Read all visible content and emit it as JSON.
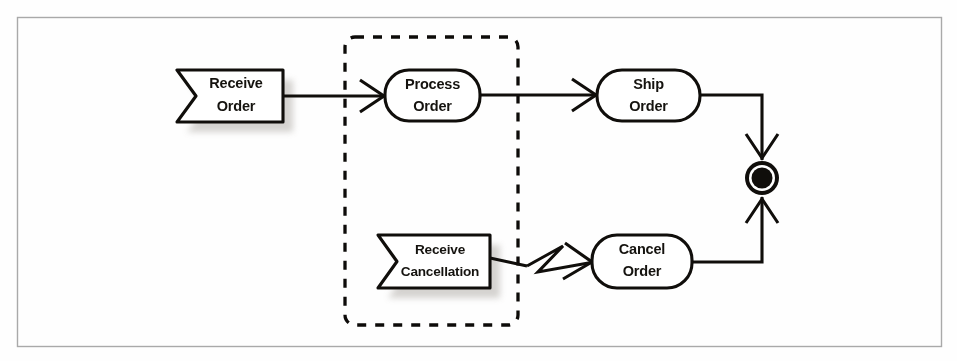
{
  "diagram": {
    "kind": "uml-activity-diagram",
    "background_color": "#fefefe",
    "frame_color": "#a9a9a9",
    "ink_color": "#100e0b",
    "shadow_color": "#b9b4ae"
  },
  "nodes": {
    "receive_order": {
      "id": "receive-order",
      "shape": "signal-receipt-flag",
      "label_line1": "Receive",
      "label_line2": "Order",
      "x": 177,
      "y": 70,
      "w": 106,
      "h": 52,
      "notch": 22,
      "has_shadow": true
    },
    "process_order": {
      "id": "process-order",
      "shape": "rounded-activity",
      "label_line1": "Process",
      "label_line2": "Order",
      "x": 385,
      "y": 70,
      "w": 95,
      "h": 51,
      "radius": 24
    },
    "ship_order": {
      "id": "ship-order",
      "shape": "rounded-activity",
      "label_line1": "Ship",
      "label_line2": "Order",
      "x": 597,
      "y": 70,
      "w": 103,
      "h": 51,
      "radius": 25
    },
    "receive_cancellation": {
      "id": "receive-cancellation",
      "shape": "signal-receipt-flag",
      "label_line1": "Receive",
      "label_line2": "Cancellation",
      "x": 378,
      "y": 235,
      "w": 112,
      "h": 53,
      "notch": 22,
      "has_shadow": true
    },
    "cancel_order": {
      "id": "cancel-order",
      "shape": "rounded-activity",
      "label_line1": "Cancel",
      "label_line2": "Order",
      "x": 592,
      "y": 235,
      "w": 100,
      "h": 53,
      "radius": 25
    },
    "activity_final": {
      "id": "activity-final-node",
      "shape": "activity-final",
      "cx": 762,
      "cy": 178,
      "r_outer": 17,
      "r_gap": 13,
      "r_core": 10.5
    }
  },
  "region": {
    "id": "interruptible-activity-region",
    "shape": "dashed-rounded-rect",
    "x": 345,
    "y": 37,
    "w": 173,
    "h": 288,
    "radius": 10
  },
  "edges": [
    {
      "id": "edge-receive-to-process",
      "from": "receive_order",
      "to": "process_order",
      "type": "control-flow",
      "arrowhead": "open-v"
    },
    {
      "id": "edge-process-to-ship",
      "from": "process_order",
      "to": "ship_order",
      "type": "control-flow",
      "arrowhead": "open-v"
    },
    {
      "id": "edge-ship-to-final",
      "from": "ship_order",
      "to": "activity_final",
      "type": "control-flow",
      "routing": "elbow-right-then-down",
      "arrowhead": "open-v"
    },
    {
      "id": "edge-cancellation-to-cancel",
      "from": "receive_cancellation",
      "to": "cancel_order",
      "type": "interrupting-edge",
      "marker": "lightning-zigzag",
      "arrowhead": "open-v"
    },
    {
      "id": "edge-cancel-to-final",
      "from": "cancel_order",
      "to": "activity_final",
      "type": "control-flow",
      "routing": "elbow-right-then-up",
      "arrowhead": "open-v"
    }
  ],
  "page_frame": {
    "x": 17,
    "y": 17,
    "w": 925,
    "h": 330
  }
}
